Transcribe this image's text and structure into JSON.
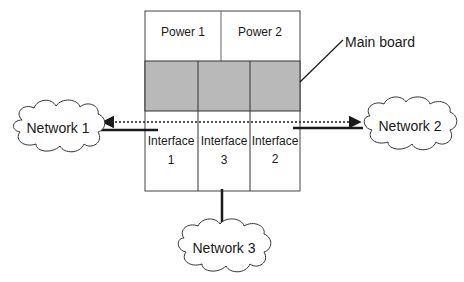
{
  "diagram": {
    "main_board_label": "Main board",
    "power_modules": [
      {
        "label": "Power 1"
      },
      {
        "label": "Power 2"
      }
    ],
    "interfaces": [
      {
        "line1": "Interface",
        "line2": "1"
      },
      {
        "line1": "Interface",
        "line2": "3"
      },
      {
        "line1": "Interface",
        "line2": "2"
      }
    ],
    "networks": [
      {
        "label": "Network 1"
      },
      {
        "label": "Network 2"
      },
      {
        "label": "Network 3"
      }
    ],
    "colors": {
      "board_fill": "#b9b9b9",
      "line": "#1a1a1a",
      "border": "#444444"
    }
  }
}
